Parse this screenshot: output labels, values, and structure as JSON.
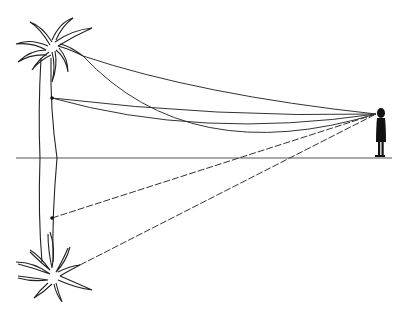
{
  "diagram": {
    "title": "Mirage: palm tree and inverted image seen by observer",
    "colors": {
      "line": "#333333",
      "fill": "#111111",
      "background": "#ffffff"
    },
    "elements": {
      "palm_tree": "upright palm tree",
      "palm_tree_reflection": "inverted palm tree image below horizon",
      "observer": "standing person silhouette",
      "horizon": "horizontal ground line",
      "rays_solid": "curved light rays from tree to observer's eye",
      "rays_dashed": "apparent straight sight lines to inverted image"
    }
  }
}
